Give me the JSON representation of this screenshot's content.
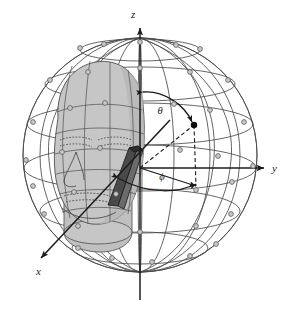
{
  "figure": {
    "type": "spherical-coordinate-head-diagram",
    "background_color": "#ffffff"
  },
  "axes": {
    "z": {
      "label": "z",
      "direction": "up",
      "arrow": true
    },
    "y": {
      "label": "y",
      "direction": "right",
      "arrow": true
    },
    "x": {
      "label": "x",
      "direction": "down-left-toward-viewer",
      "arrow": true
    }
  },
  "angles": {
    "theta": {
      "label": "θ",
      "description": "elevation angle from z-axis",
      "arc": "double-headed"
    },
    "phi": {
      "label": "ϕ",
      "description": "azimuth angle in xy-plane",
      "arc": "double-headed"
    }
  },
  "sphere": {
    "line_color": "#4a4a4a",
    "node_fill": "#c9c9c9",
    "node_stroke": "#5a5a5a",
    "node_radius": 2.4,
    "meridian_count": 7,
    "parallel_count": 5
  },
  "head": {
    "fill": "#c6c6c6",
    "outline": "#4f4f4f",
    "shading": "#b3b3b3"
  },
  "device": {
    "name": "probe-bar",
    "fill": "#4a4a4a",
    "fill_light": "#6e6e6e",
    "outline": "#1c1c1c"
  },
  "markers": {
    "point": {
      "fill": "#0d0d0d",
      "label": ""
    }
  },
  "colors": {
    "ink": "#1b1b1b",
    "grid": "#4a4a4a",
    "dashed": "#1b1b1b"
  }
}
